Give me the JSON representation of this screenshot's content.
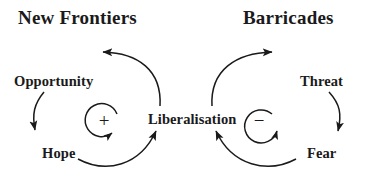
{
  "diagram": {
    "kind": "causal-loop-diagram",
    "background_color": "#ffffff",
    "stroke_color": "#1a1a1a",
    "titles": {
      "left": "New Frontiers",
      "right": "Barricades"
    },
    "nodes": {
      "opportunity": "Opportunity",
      "hope": "Hope",
      "liberalisation": "Liberalisation",
      "threat": "Threat",
      "fear": "Fear"
    },
    "loops": {
      "left": {
        "polarity_symbol": "+",
        "polarity_name": "reinforcing",
        "direction": "clockwise",
        "title": "New Frontiers"
      },
      "right": {
        "polarity_symbol": "−",
        "polarity_name": "balancing",
        "direction": "clockwise",
        "title": "Barricades"
      }
    },
    "links": [
      {
        "from": "Liberalisation",
        "to": "Opportunity",
        "shape": "arc-up-left"
      },
      {
        "from": "Opportunity",
        "to": "Hope",
        "shape": "arc-down-left"
      },
      {
        "from": "Hope",
        "to": "Liberalisation",
        "shape": "arc-up-right"
      },
      {
        "from": "Liberalisation",
        "to": "Threat",
        "shape": "arc-up-right"
      },
      {
        "from": "Threat",
        "to": "Fear",
        "shape": "arc-down-right"
      },
      {
        "from": "Fear",
        "to": "Liberalisation",
        "shape": "arc-up-left"
      }
    ]
  }
}
